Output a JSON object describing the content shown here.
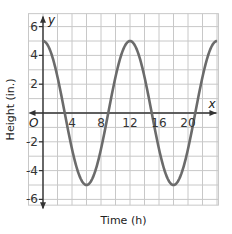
{
  "chart_data": {
    "type": "line",
    "title": "",
    "xlabel": "Time (h)",
    "ylabel": "Height (in.)",
    "x_axis_var": "x",
    "y_axis_var": "y",
    "origin_label": "O",
    "xlim": [
      -1,
      24
    ],
    "ylim": [
      -6.5,
      6.5
    ],
    "x_ticks": [
      "4",
      "8",
      "12",
      "16",
      "20"
    ],
    "y_ticks": [
      "6",
      "4",
      "2",
      "-2",
      "-4",
      "-6"
    ],
    "grid": true,
    "series": [
      {
        "name": "height",
        "equation": "y = 5cos(pi*x/6)",
        "x": [
          0,
          3,
          6,
          9,
          12,
          15,
          18,
          21,
          24
        ],
        "values": [
          5,
          0,
          -5,
          0,
          5,
          0,
          -5,
          0,
          5
        ],
        "color": "#6b6b6b"
      }
    ]
  }
}
